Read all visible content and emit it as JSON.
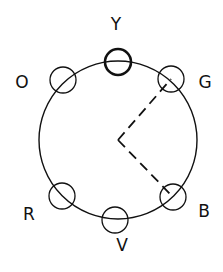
{
  "diagram": {
    "type": "color-wheel",
    "stroke_color": "#111111",
    "background": "#ffffff",
    "wheel": {
      "cx": 118,
      "cy": 140,
      "r": 79
    },
    "vertex": {
      "x": 118,
      "y": 140
    },
    "nodes": [
      {
        "id": "Y",
        "label": "Y",
        "cx": 118,
        "cy": 62,
        "r": 13,
        "highlighted": true,
        "label_x": 116,
        "label_y": 25
      },
      {
        "id": "G",
        "label": "G",
        "cx": 171,
        "cy": 79,
        "r": 13,
        "highlighted": false,
        "label_x": 205,
        "label_y": 83
      },
      {
        "id": "B",
        "label": "B",
        "cx": 173,
        "cy": 197,
        "r": 13,
        "highlighted": false,
        "label_x": 204,
        "label_y": 212
      },
      {
        "id": "V",
        "label": "V",
        "cx": 115,
        "cy": 220,
        "r": 13,
        "highlighted": false,
        "label_x": 122,
        "label_y": 246
      },
      {
        "id": "R",
        "label": "R",
        "cx": 62,
        "cy": 196,
        "r": 13,
        "highlighted": false,
        "label_x": 29,
        "label_y": 215
      },
      {
        "id": "O",
        "label": "O",
        "cx": 63,
        "cy": 80,
        "r": 13,
        "highlighted": false,
        "label_x": 22,
        "label_y": 83
      }
    ],
    "dashed_connections": [
      {
        "from": "vertex",
        "to": "G"
      },
      {
        "from": "vertex",
        "to": "B"
      }
    ]
  }
}
